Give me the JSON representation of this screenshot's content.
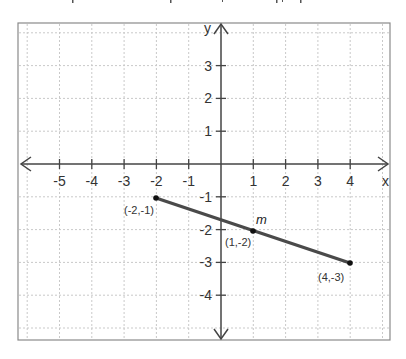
{
  "chart_data": {
    "type": "line",
    "title": "",
    "xlabel": "x",
    "ylabel": "y",
    "xlim": [
      -6.3,
      5.2
    ],
    "ylim": [
      -5.3,
      4.3
    ],
    "grid": true,
    "x_ticks": [
      -5,
      -4,
      -3,
      -2,
      -1,
      1,
      2,
      3,
      4
    ],
    "y_ticks": [
      3,
      2,
      1,
      -1,
      -2,
      -3,
      -4
    ],
    "series": [
      {
        "name": "segment",
        "points": [
          {
            "x": -2,
            "y": -1,
            "label": "(-2,-1)"
          },
          {
            "x": 4,
            "y": -3,
            "label": "(4,-3)"
          }
        ]
      }
    ],
    "annotations": [
      {
        "x": 1,
        "y": -2,
        "label": "(1,-2)",
        "marker": "dot"
      },
      {
        "x": 1.3,
        "y": -1.6,
        "label": "m",
        "style": "italic"
      }
    ]
  },
  "axes": {
    "x_label": "x",
    "y_label": "y",
    "x_tick_labels": [
      "-5",
      "-4",
      "-3",
      "-2",
      "-1",
      "1",
      "2",
      "3",
      "4"
    ],
    "y_tick_labels": [
      "3",
      "2",
      "1",
      "-1",
      "-2",
      "-3",
      "-4"
    ]
  },
  "points": {
    "start_label": "(-2,-1)",
    "midpoint_label": "(1,-2)",
    "end_label": "(4,-3)",
    "segment_name": "m"
  },
  "colors": {
    "segment": "#4a4a4a",
    "axis": "#444444",
    "grid": "#c8c8c8",
    "frame": "#888888"
  }
}
